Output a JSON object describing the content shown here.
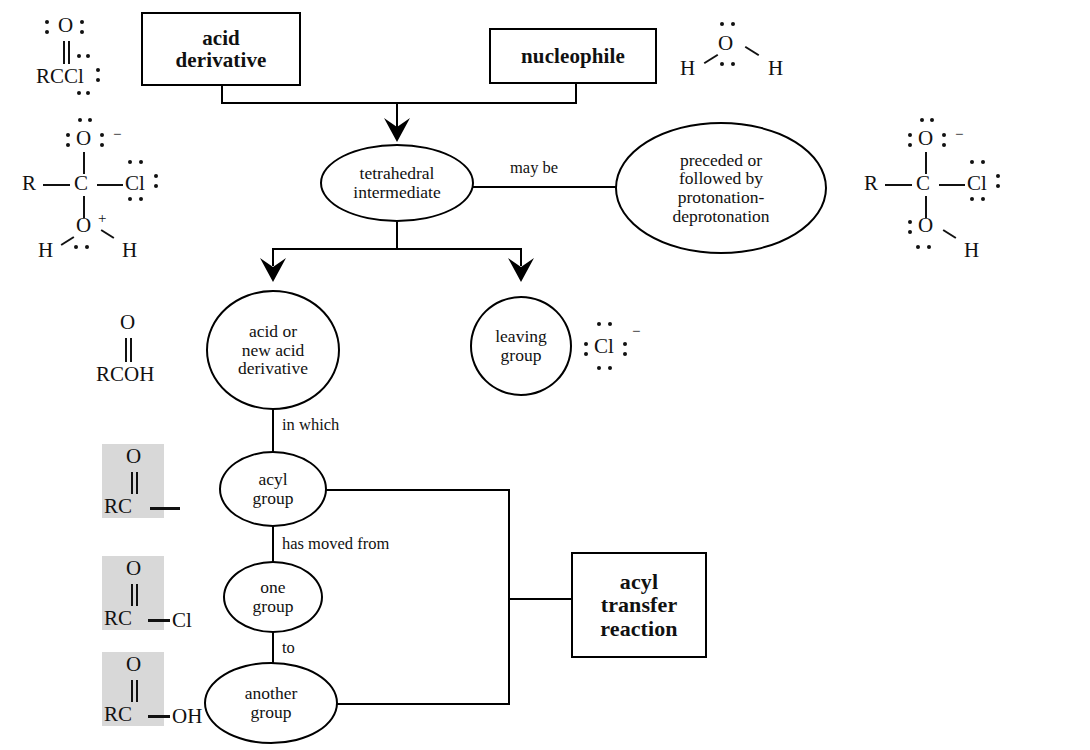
{
  "diagram": {
    "background": "#ffffff",
    "line_color": "#000000",
    "shade_color": "#d8d8d8"
  },
  "nodes": {
    "acid_derivative": {
      "label": "acid\nderivative",
      "shape": "rect"
    },
    "nucleophile": {
      "label": "nucleophile",
      "shape": "rect"
    },
    "tetrahedral_intermediate": {
      "label": "tetrahedral\nintermediate",
      "shape": "ellipse"
    },
    "protonation": {
      "label": "preceded or\nfollowed by\nprotonation-\ndeprotonation",
      "shape": "ellipse"
    },
    "acid_or_new": {
      "label": "acid or\nnew acid\nderivative",
      "shape": "circle"
    },
    "leaving_group": {
      "label": "leaving\ngroup",
      "shape": "circle"
    },
    "acyl_group": {
      "label": "acyl\ngroup",
      "shape": "ellipse"
    },
    "one_group": {
      "label": "one\ngroup",
      "shape": "ellipse"
    },
    "another_group": {
      "label": "another\ngroup",
      "shape": "ellipse"
    },
    "acyl_transfer": {
      "label": "acyl\ntransfer\nreaction",
      "shape": "rect"
    }
  },
  "edge_labels": {
    "may_be": "may be",
    "in_which": "in which",
    "has_moved_from": "has moved from",
    "to": "to"
  },
  "structures": {
    "acid_chloride_top": {
      "name": "acyl chloride Lewis structure",
      "atoms": [
        "O",
        "RCCl"
      ],
      "formula": "RCOCl",
      "shaded": false
    },
    "tetrahedral_cation": {
      "name": "protonated tetrahedral intermediate",
      "atoms": [
        "O",
        "R",
        "C",
        "Cl",
        "O",
        "H",
        "H"
      ],
      "charges": [
        "-",
        "+"
      ],
      "shaded": false
    },
    "tetrahedral_anion": {
      "name": "tetrahedral intermediate anion",
      "atoms": [
        "O",
        "R",
        "C",
        "Cl",
        "O",
        "H"
      ],
      "charges": [
        "-"
      ],
      "shaded": false
    },
    "water": {
      "name": "water nucleophile",
      "atoms": [
        "O",
        "H",
        "H"
      ],
      "shaded": false
    },
    "carboxylic_acid": {
      "name": "carboxylic acid",
      "atoms": [
        "O",
        "RCOH"
      ],
      "shaded": false
    },
    "chloride_ion": {
      "name": "chloride ion",
      "atoms": [
        "Cl"
      ],
      "charges": [
        "-"
      ],
      "shaded": false
    },
    "acyl_fragment": {
      "name": "acyl group fragment",
      "atoms": [
        "O",
        "RC"
      ],
      "tail": "",
      "shaded": true
    },
    "acyl_chloride_frag": {
      "name": "acyl chloride fragment",
      "atoms": [
        "O",
        "RC"
      ],
      "tail": "Cl",
      "shaded": true
    },
    "acyl_hydroxy_frag": {
      "name": "carboxylic acid fragment",
      "atoms": [
        "O",
        "RC"
      ],
      "tail": "OH",
      "shaded": true
    }
  }
}
